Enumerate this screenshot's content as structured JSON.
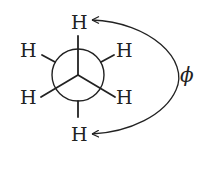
{
  "diagram": {
    "type": "newman-projection",
    "front_atoms": {
      "top": "H",
      "lower_left": "H",
      "lower_right": "H"
    },
    "back_atoms": {
      "upper_left": "H",
      "upper_right": "H",
      "bottom": "H"
    },
    "angle_label": "ϕ",
    "colors": {
      "stroke": "#222222",
      "background": "#ffffff"
    }
  }
}
